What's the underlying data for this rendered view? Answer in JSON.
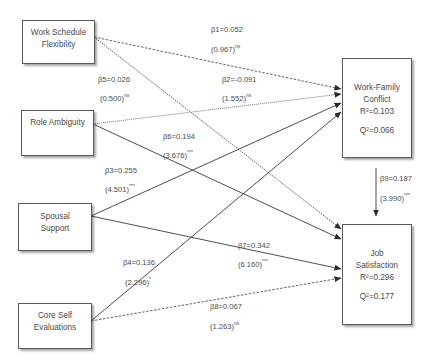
{
  "nodes": {
    "wsf": {
      "label_line1": "Work Schedule",
      "label_line2": "Flexibility"
    },
    "ra": {
      "label_line1": "Role Ambiguity"
    },
    "ss": {
      "label_line1": "Spousal",
      "label_line2": "Support"
    },
    "cse": {
      "label_line1": "Core Self",
      "label_line2": "Evaluations"
    },
    "wfc": {
      "label_line1": "Work-Family",
      "label_line2": "Conflict",
      "r2": "R²=0.103",
      "q2": "Q²=0.066"
    },
    "js": {
      "label_line1": "Job",
      "label_line2": "Satisfaction",
      "r2": "R²=0.296",
      "q2": "Q²=0.177"
    }
  },
  "paths": [
    {
      "id": "b1",
      "from": "Work Schedule Flexibility",
      "to": "Work-Family Conflict",
      "beta": "β1=0.052",
      "t": "(0.967)",
      "sig": "ns",
      "style": "dashed"
    },
    {
      "id": "b2",
      "from": "Role Ambiguity",
      "to": "Work-Family Conflict",
      "beta": "β2=-0.091",
      "t": "(1.552)",
      "sig": "ns",
      "style": "dotted"
    },
    {
      "id": "b3",
      "from": "Spousal Support",
      "to": "Work-Family Conflict",
      "beta": "β3=0.255",
      "t": "(4.501)",
      "sig": "***",
      "style": "solid"
    },
    {
      "id": "b4",
      "from": "Core Self Evaluations",
      "to": "Work-Family Conflict",
      "beta": "β4=0.136",
      "t": "(2.296)",
      "sig": "*",
      "style": "solid"
    },
    {
      "id": "b5",
      "from": "Work Schedule Flexibility",
      "to": "Job Satisfaction",
      "beta": "β5=0.026",
      "t": "(0.500)",
      "sig": "ns",
      "style": "dotted"
    },
    {
      "id": "b6",
      "from": "Role Ambiguity",
      "to": "Job Satisfaction",
      "beta": "β6=0.194",
      "t": "(3.676)",
      "sig": "***",
      "style": "solid"
    },
    {
      "id": "b7",
      "from": "Spousal Support",
      "to": "Job Satisfaction",
      "beta": "β7=0.342",
      "t": "(6.160)",
      "sig": "***",
      "style": "solid"
    },
    {
      "id": "b8",
      "from": "Core Self Evaluations",
      "to": "Job Satisfaction",
      "beta": "β8=0.067",
      "t": "(1.263)",
      "sig": "ns",
      "style": "dashed"
    },
    {
      "id": "b9",
      "from": "Work-Family Conflict",
      "to": "Job Satisfaction",
      "beta": "β9=0.187",
      "t": "(3.990)",
      "sig": "***",
      "style": "solid"
    }
  ],
  "colors": {
    "line": "#3a3a3a",
    "text": "#4a4a4a",
    "border": "#5a5a5a"
  }
}
